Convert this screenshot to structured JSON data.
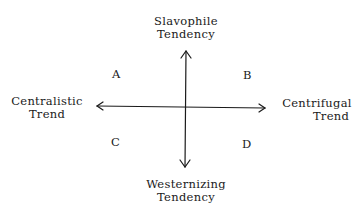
{
  "diagram": {
    "axes": {
      "top": {
        "line1": "Slavophile",
        "line2": "Tendency"
      },
      "bottom": {
        "line1": "Westernizing",
        "line2": "Tendency"
      },
      "left": {
        "line1": "Centralistic",
        "line2": "Trend"
      },
      "right": {
        "line1": "Centrifugal",
        "line2": "Trend"
      }
    },
    "quadrants": {
      "top_left": "A",
      "top_right": "B",
      "bottom_left": "C",
      "bottom_right": "D"
    },
    "colors": {
      "line": "#1a1a1a",
      "background": "#ffffff"
    }
  }
}
